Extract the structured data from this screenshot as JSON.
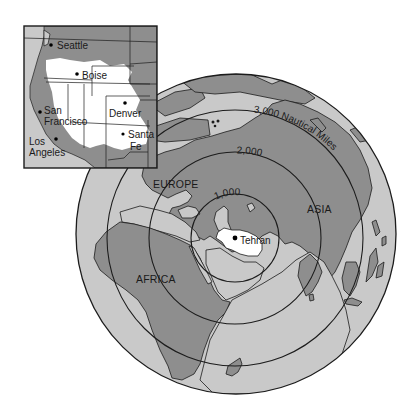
{
  "colors": {
    "ocean": "#c9c9c9",
    "land": "#8e8e8e",
    "highlight": "#ffffff",
    "outline": "#1c1c1c",
    "background": "#ffffff"
  },
  "globe": {
    "center_city": "Tehran",
    "continents": [
      "EUROPE",
      "ASIA",
      "AFRICA"
    ],
    "range_rings": [
      {
        "label": "1,000",
        "radius_nm": 1000
      },
      {
        "label": "2,000",
        "radius_nm": 2000
      },
      {
        "label": "3,000 Nautical Miles",
        "radius_nm": 3000
      }
    ]
  },
  "inset": {
    "region": "Western United States",
    "cities": [
      "Seattle",
      "Boise",
      "San Francisco",
      "Denver",
      "Los Angeles",
      "Santa Fe"
    ],
    "labels": {
      "seattle": "Seattle",
      "boise": "Boise",
      "san": "San",
      "francisco": "Francisco",
      "denver": "Denver",
      "los": "Los",
      "angeles": "Angeles",
      "santa": "Santa",
      "fe": "Fe"
    }
  },
  "labels": {
    "europe": "EUROPE",
    "asia": "ASIA",
    "africa": "AFRICA",
    "tehran": "Tehran",
    "ring1": "1,000",
    "ring2": "2,000",
    "ring3": "3,000 Nautical Miles"
  }
}
